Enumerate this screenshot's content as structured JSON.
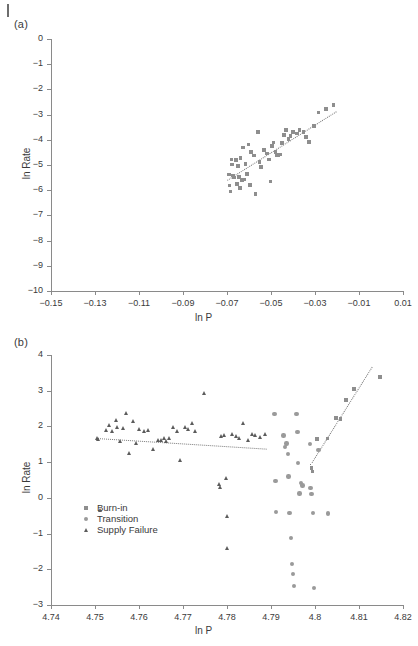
{
  "figure": {
    "panels": [
      {
        "id": "a",
        "label": "(a)",
        "chart_data": {
          "type": "scatter",
          "title": "",
          "xlabel": "ln P",
          "ylabel": "ln Rate",
          "xlim": [
            -0.15,
            0.01
          ],
          "ylim": [
            -10,
            0
          ],
          "xticks": [
            "-0.15",
            "-0.13",
            "-0.11",
            "-0.09",
            "-0.07",
            "-0.05",
            "-0.03",
            "-0.01",
            "0.01"
          ],
          "xtick_values": [
            -0.15,
            -0.13,
            -0.11,
            -0.09,
            -0.07,
            -0.05,
            -0.03,
            -0.01,
            0.01
          ],
          "yticks": [
            "0",
            "-1",
            "-2",
            "-3",
            "-4",
            "-5",
            "-6",
            "-7",
            "-8",
            "-9",
            "-10"
          ],
          "ytick_values": [
            0,
            -1,
            -2,
            -3,
            -4,
            -5,
            -6,
            -7,
            -8,
            -9,
            -10
          ],
          "grid": false,
          "legend": "none",
          "series": [
            {
              "name": "data",
              "marker": "square",
              "color": "#8e8e8e",
              "points": [
                [
                  -0.069,
                  -5.38
                ],
                [
                  -0.0688,
                  -5.82
                ],
                [
                  -0.0685,
                  -6.05
                ],
                [
                  -0.068,
                  -4.78
                ],
                [
                  -0.0678,
                  -4.98
                ],
                [
                  -0.0672,
                  -5.42
                ],
                [
                  -0.0668,
                  -5.5
                ],
                [
                  -0.066,
                  -4.8
                ],
                [
                  -0.0655,
                  -5.75
                ],
                [
                  -0.065,
                  -5.05
                ],
                [
                  -0.0646,
                  -5.48
                ],
                [
                  -0.0642,
                  -5.92
                ],
                [
                  -0.0638,
                  -4.72
                ],
                [
                  -0.0632,
                  -5.6
                ],
                [
                  -0.0628,
                  -4.3
                ],
                [
                  -0.0622,
                  -5.57
                ],
                [
                  -0.0615,
                  -4.95
                ],
                [
                  -0.061,
                  -5.35
                ],
                [
                  -0.0602,
                  -4.18
                ],
                [
                  -0.0596,
                  -5.8
                ],
                [
                  -0.059,
                  -4.48
                ],
                [
                  -0.0578,
                  -4.62
                ],
                [
                  -0.057,
                  -6.14
                ],
                [
                  -0.056,
                  -3.7
                ],
                [
                  -0.0552,
                  -4.88
                ],
                [
                  -0.0545,
                  -5.08
                ],
                [
                  -0.0532,
                  -4.4
                ],
                [
                  -0.0518,
                  -4.55
                ],
                [
                  -0.051,
                  -4.78
                ],
                [
                  -0.0502,
                  -5.65
                ],
                [
                  -0.0495,
                  -4.25
                ],
                [
                  -0.0488,
                  -4.1
                ],
                [
                  -0.048,
                  -4.48
                ],
                [
                  -0.0472,
                  -4.6
                ],
                [
                  -0.0465,
                  -4.62
                ],
                [
                  -0.0458,
                  -4.58
                ],
                [
                  -0.045,
                  -4.12
                ],
                [
                  -0.044,
                  -3.8
                ],
                [
                  -0.0432,
                  -3.62
                ],
                [
                  -0.042,
                  -3.98
                ],
                [
                  -0.0412,
                  -3.85
                ],
                [
                  -0.04,
                  -3.68
                ],
                [
                  -0.0382,
                  -3.75
                ],
                [
                  -0.037,
                  -3.62
                ],
                [
                  -0.0352,
                  -3.7
                ],
                [
                  -0.034,
                  -3.88
                ],
                [
                  -0.0328,
                  -4.08
                ],
                [
                  -0.0305,
                  -3.45
                ],
                [
                  -0.0285,
                  -2.92
                ],
                [
                  -0.025,
                  -2.78
                ],
                [
                  -0.0215,
                  -2.62
                ]
              ]
            }
          ],
          "fit_lines": [
            {
              "name": "trend",
              "style": "dotted",
              "x1": -0.07,
              "y1": -5.6,
              "x2": -0.0205,
              "y2": -2.88
            }
          ]
        }
      },
      {
        "id": "b",
        "label": "(b)",
        "chart_data": {
          "type": "scatter",
          "title": "",
          "xlabel": "ln P",
          "ylabel": "ln Rate",
          "xlim": [
            4.74,
            4.82
          ],
          "ylim": [
            -3,
            4
          ],
          "xticks": [
            "4.74",
            "4.75",
            "4.76",
            "4.77",
            "4.78",
            "4.79",
            "4.8",
            "4.81",
            "4.82"
          ],
          "xtick_values": [
            4.74,
            4.75,
            4.76,
            4.77,
            4.78,
            4.79,
            4.8,
            4.81,
            4.82
          ],
          "yticks": [
            "4",
            "3",
            "2",
            "1",
            "0",
            "-1",
            "-2",
            "-3"
          ],
          "ytick_values": [
            4,
            3,
            2,
            1,
            0,
            -1,
            -2,
            -3
          ],
          "grid": false,
          "legend": "inside-left",
          "legend_items": [
            {
              "label": "Burn-in",
              "marker": "square",
              "color": "#8e8e8e"
            },
            {
              "label": "Transition",
              "marker": "circle",
              "color": "#9a9a9a"
            },
            {
              "label": "Supply Failure",
              "marker": "triangle",
              "color": "#5c5c5c"
            }
          ],
          "series": [
            {
              "name": "Supply Failure",
              "marker": "triangle",
              "color": "#5c5c5c",
              "points": [
                [
                  4.7505,
                  1.68
                ],
                [
                  4.7508,
                  1.64
                ],
                [
                  4.7512,
                  -0.33
                ],
                [
                  4.7525,
                  1.9
                ],
                [
                  4.7532,
                  2.05
                ],
                [
                  4.754,
                  1.86
                ],
                [
                  4.7548,
                  2.18
                ],
                [
                  4.7552,
                  1.97
                ],
                [
                  4.7558,
                  1.6
                ],
                [
                  4.7565,
                  1.95
                ],
                [
                  4.7572,
                  2.37
                ],
                [
                  4.7578,
                  1.26
                ],
                [
                  4.7588,
                  2.15
                ],
                [
                  4.7595,
                  1.52
                ],
                [
                  4.7602,
                  1.92
                ],
                [
                  4.7612,
                  1.88
                ],
                [
                  4.7622,
                  1.9
                ],
                [
                  4.7632,
                  1.36
                ],
                [
                  4.7645,
                  1.62
                ],
                [
                  4.7652,
                  1.62
                ],
                [
                  4.7658,
                  1.66
                ],
                [
                  4.7662,
                  1.58
                ],
                [
                  4.7668,
                  1.66
                ],
                [
                  4.7678,
                  1.98
                ],
                [
                  4.7688,
                  1.87
                ],
                [
                  4.7695,
                  1.05
                ],
                [
                  4.7705,
                  1.98
                ],
                [
                  4.7712,
                  1.92
                ],
                [
                  4.7722,
                  2.1
                ],
                [
                  4.7728,
                  1.88
                ],
                [
                  4.7748,
                  2.93
                ],
                [
                  4.7782,
                  0.38
                ],
                [
                  4.7785,
                  0.3
                ],
                [
                  4.7788,
                  1.72
                ],
                [
                  4.7795,
                  1.75
                ],
                [
                  4.7798,
                  0.56
                ],
                [
                  4.78,
                  -0.52
                ],
                [
                  4.7802,
                  -1.42
                ],
                [
                  4.7812,
                  1.78
                ],
                [
                  4.7822,
                  1.72
                ],
                [
                  4.7828,
                  1.68
                ],
                [
                  4.7838,
                  2.1
                ],
                [
                  4.7848,
                  1.62
                ],
                [
                  4.7858,
                  1.78
                ],
                [
                  4.7865,
                  1.76
                ],
                [
                  4.7875,
                  1.7
                ],
                [
                  4.7888,
                  1.78
                ]
              ]
            },
            {
              "name": "Transition",
              "marker": "circle",
              "color": "#9a9a9a",
              "points": [
                [
                  4.7908,
                  2.35
                ],
                [
                  4.791,
                  0.48
                ],
                [
                  4.7912,
                  -0.4
                ],
                [
                  4.7928,
                  1.75
                ],
                [
                  4.7932,
                  1.42
                ],
                [
                  4.7935,
                  1.52
                ],
                [
                  4.7938,
                  1.22
                ],
                [
                  4.794,
                  0.6
                ],
                [
                  4.7942,
                  -0.42
                ],
                [
                  4.7945,
                  -1.12
                ],
                [
                  4.7948,
                  -1.85
                ],
                [
                  4.795,
                  -2.14
                ],
                [
                  4.7952,
                  -2.47
                ],
                [
                  4.7958,
                  2.34
                ],
                [
                  4.796,
                  1.85
                ],
                [
                  4.7962,
                  0.97
                ],
                [
                  4.7965,
                  0.12
                ],
                [
                  4.7968,
                  0.42
                ],
                [
                  4.7972,
                  0.35
                ],
                [
                  4.7988,
                  1.5
                ],
                [
                  4.799,
                  0.28
                ],
                [
                  4.7992,
                  0.1
                ],
                [
                  4.7995,
                  -0.42
                ],
                [
                  4.7998,
                  -2.52
                ],
                [
                  4.8008,
                  1.34
                ],
                [
                  4.803,
                  -0.44
                ]
              ]
            },
            {
              "name": "Burn-in",
              "marker": "square",
              "color": "#8e8e8e",
              "points": [
                [
                  4.7992,
                  0.84
                ],
                [
                  4.7994,
                  0.74
                ],
                [
                  4.8005,
                  1.64
                ],
                [
                  4.8028,
                  1.66
                ],
                [
                  4.8048,
                  2.24
                ],
                [
                  4.8058,
                  2.2
                ],
                [
                  4.807,
                  2.74
                ],
                [
                  4.8088,
                  3.05
                ],
                [
                  4.8148,
                  3.38
                ]
              ]
            }
          ],
          "fit_lines": [
            {
              "name": "supply-failure-trend",
              "style": "dotted",
              "x1": 4.7503,
              "y1": 1.68,
              "x2": 4.7892,
              "y2": 1.38
            },
            {
              "name": "burn-in-trend",
              "style": "dotted",
              "x1": 4.7988,
              "y1": 0.92,
              "x2": 4.8128,
              "y2": 3.66
            }
          ]
        }
      }
    ]
  }
}
